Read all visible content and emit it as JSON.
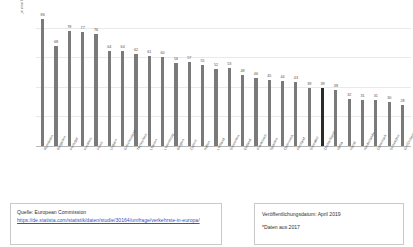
{
  "chart_data": {
    "type": "bar",
    "title": "",
    "xlabel": "",
    "ylabel": "je eine Million Einwohner",
    "ylim": [
      0,
      90
    ],
    "grid": true,
    "legend": "none",
    "highlight_category": "Deutschland",
    "categories": [
      "Rumänien",
      "Bulgarien",
      "Portugal",
      "Kroatien",
      "Polen",
      "Ungarn",
      "Griechenland",
      "Tschechien",
      "Litauen",
      "Luxemburg",
      "Belgien",
      "Zypern",
      "Italien",
      "Lettland",
      "Slowenien",
      "Estland",
      "Frankreich",
      "Spanien",
      "Österreich",
      "Finnland",
      "Slowakei",
      "Deutschland",
      "Malta",
      "Irland",
      "Niederlande",
      "Dänemark",
      "Schweden",
      "Großbritannien"
    ],
    "values": [
      86,
      68,
      78,
      77,
      76,
      64,
      64,
      62,
      61,
      60,
      56,
      57,
      55,
      52,
      53,
      48,
      46,
      45,
      44,
      43,
      39,
      39,
      38,
      32,
      31,
      31,
      30,
      28
    ],
    "value_labels": [
      "86",
      "68",
      "78",
      "77",
      "76",
      "64",
      "64",
      "62",
      "61",
      "60",
      "56",
      "57",
      "55",
      "52",
      "53",
      "48",
      "46",
      "45",
      "44",
      "43",
      "39",
      "39",
      "38",
      "32",
      "31",
      "31",
      "30",
      "28"
    ],
    "gridline_values": [
      0,
      20,
      40,
      60,
      80
    ]
  },
  "source": {
    "label": "Quelle: European Commission",
    "url": "https://de.statista.com/statistik/daten/studie/30164/umfrage/verkehrste-in-europa/"
  },
  "meta": {
    "publication": "Veröffentlichungsdatum: April 2019",
    "note": "*Daten aus 2017"
  }
}
